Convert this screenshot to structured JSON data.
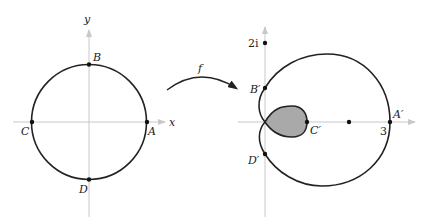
{
  "left_plane": {
    "x_axis_label": "x",
    "y_axis_label": "y",
    "curve": "unit circle",
    "points": [
      {
        "name": "A",
        "label": "A"
      },
      {
        "name": "B",
        "label": "B"
      },
      {
        "name": "C",
        "label": "C"
      },
      {
        "name": "D",
        "label": "D"
      }
    ]
  },
  "mapping": {
    "label": "f"
  },
  "right_plane": {
    "imag_tick_label": "2i",
    "real_tick_label": "3",
    "points": [
      {
        "name": "A-prime",
        "label": "A′"
      },
      {
        "name": "B-prime",
        "label": "B′"
      },
      {
        "name": "C-prime",
        "label": "C′"
      },
      {
        "name": "D-prime",
        "label": "D′"
      }
    ]
  },
  "colors": {
    "axis": "#c8c8c8",
    "curve": "#222222",
    "fill": "#a9a9a9"
  }
}
